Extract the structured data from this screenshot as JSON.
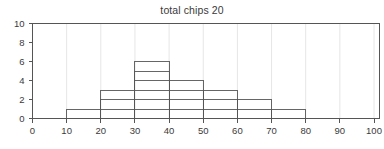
{
  "chart_data": {
    "type": "bar",
    "title": "total chips 20",
    "xlabel": "",
    "ylabel": "",
    "categories": [
      "0-10",
      "10-20",
      "20-30",
      "30-40",
      "40-50",
      "50-60",
      "60-70",
      "70-80",
      "80-90",
      "90-100"
    ],
    "bin_edges": [
      0,
      10,
      20,
      30,
      40,
      50,
      60,
      70,
      80,
      90,
      100
    ],
    "values": [
      0,
      1,
      3,
      6,
      4,
      3,
      2,
      1,
      0,
      0
    ],
    "bin_starts": [
      0,
      10,
      20,
      30,
      40,
      50,
      60,
      70,
      80,
      90
    ],
    "bin_width": 10,
    "total": 20,
    "xlim": [
      0,
      100
    ],
    "ylim": [
      0,
      10
    ],
    "xticks": [
      0,
      10,
      20,
      30,
      40,
      50,
      60,
      70,
      80,
      90,
      100
    ],
    "yticks": [
      0,
      2,
      4,
      6,
      8,
      10
    ],
    "xtick_labels": [
      "0",
      "10",
      "20",
      "30",
      "40",
      "50",
      "60",
      "70",
      "80",
      "90",
      "100"
    ],
    "ytick_labels": [
      "0",
      "2",
      "4",
      "6",
      "8",
      "10"
    ],
    "grid": true,
    "grid_axis": "x",
    "legend": false,
    "legend_position": "none",
    "style": "outline-step-histogram",
    "colors": {
      "axis": "#555555",
      "bar_outline": "#555555",
      "grid": "#e6e6e6",
      "text": "#3a3a3a",
      "background": "#ffffff"
    }
  }
}
